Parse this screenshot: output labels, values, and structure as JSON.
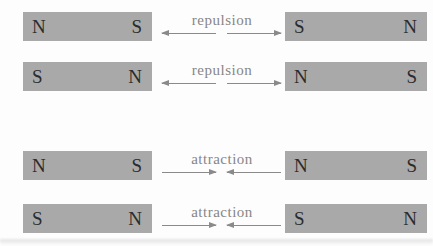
{
  "figure": {
    "description_labels": [
      "repulsion",
      "attraction"
    ],
    "colors": {
      "magnet_fill": "#a9a9a9",
      "pole_text": "#2b2b2b",
      "label_text": "#868686",
      "arrow": "#8a8a8a",
      "background": "#fdfdfd"
    }
  },
  "rows": [
    {
      "type": "repulsion",
      "label": "repulsion",
      "left_magnet": {
        "left_pole": "N",
        "right_pole": "S"
      },
      "right_magnet": {
        "left_pole": "S",
        "right_pole": "N"
      }
    },
    {
      "type": "repulsion",
      "label": "repulsion",
      "left_magnet": {
        "left_pole": "S",
        "right_pole": "N"
      },
      "right_magnet": {
        "left_pole": "N",
        "right_pole": "S"
      }
    },
    {
      "type": "attraction",
      "label": "attraction",
      "left_magnet": {
        "left_pole": "N",
        "right_pole": "S"
      },
      "right_magnet": {
        "left_pole": "N",
        "right_pole": "S"
      }
    },
    {
      "type": "attraction",
      "label": "attraction",
      "left_magnet": {
        "left_pole": "S",
        "right_pole": "N"
      },
      "right_magnet": {
        "left_pole": "S",
        "right_pole": "N"
      }
    }
  ]
}
